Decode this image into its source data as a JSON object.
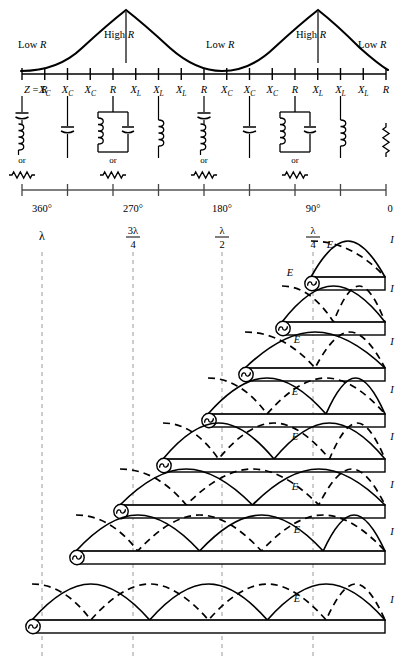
{
  "figure": {
    "impedance_curve": {
      "labels": [
        {
          "text": "Low R",
          "x": 38,
          "y": 44
        },
        {
          "text": "High R",
          "x": 128,
          "y": 38
        },
        {
          "text": "Low R",
          "x": 228,
          "y": 44
        },
        {
          "text": "High R",
          "x": 320,
          "y": 38
        },
        {
          "text": "Low R",
          "x": 382,
          "y": 44
        }
      ]
    },
    "impedance_axis": {
      "tick_labels": [
        "Z = R",
        "X_C",
        "X_C",
        "X_C",
        "R",
        "X_L",
        "X_L",
        "X_L",
        "R",
        "X_C",
        "X_C",
        "X_C",
        "R",
        "X_L",
        "X_L",
        "X_L",
        "R"
      ],
      "tick_display": [
        {
          "main": "Z = R",
          "sub": ""
        },
        {
          "main": "X",
          "sub": "C"
        },
        {
          "main": "X",
          "sub": "C"
        },
        {
          "main": "X",
          "sub": "C"
        },
        {
          "main": "R",
          "sub": ""
        },
        {
          "main": "X",
          "sub": "L"
        },
        {
          "main": "X",
          "sub": "L"
        },
        {
          "main": "X",
          "sub": "L"
        },
        {
          "main": "R",
          "sub": ""
        },
        {
          "main": "X",
          "sub": "C"
        },
        {
          "main": "X",
          "sub": "C"
        },
        {
          "main": "X",
          "sub": "C"
        },
        {
          "main": "R",
          "sub": ""
        },
        {
          "main": "X",
          "sub": "L"
        },
        {
          "main": "X",
          "sub": "L"
        },
        {
          "main": "X",
          "sub": "L"
        },
        {
          "main": "R",
          "sub": ""
        }
      ]
    },
    "equivalent_circuits": [
      {
        "index": 0,
        "type": "series-LC",
        "or_label": "or",
        "alt": "resistor"
      },
      {
        "index": 1,
        "type": "capacitor",
        "or_label": "",
        "alt": ""
      },
      {
        "index": 2,
        "type": "parallel-LC-tank",
        "or_label": "or",
        "alt": "resistor"
      },
      {
        "index": 3,
        "type": "inductor",
        "or_label": "",
        "alt": ""
      },
      {
        "index": 4,
        "type": "series-LC",
        "or_label": "or",
        "alt": "resistor"
      },
      {
        "index": 5,
        "type": "capacitor",
        "or_label": "",
        "alt": ""
      },
      {
        "index": 6,
        "type": "parallel-LC-tank",
        "or_label": "or",
        "alt": "resistor"
      },
      {
        "index": 7,
        "type": "inductor",
        "or_label": "",
        "alt": ""
      },
      {
        "index": 8,
        "type": "resistor-vertical",
        "or_label": "",
        "alt": ""
      }
    ],
    "degree_axis": {
      "labels": [
        {
          "text": "360°",
          "x": 42
        },
        {
          "text": "270°",
          "x": 133
        },
        {
          "text": "180°",
          "x": 222
        },
        {
          "text": "90°",
          "x": 313
        },
        {
          "text": "0",
          "x": 390
        }
      ]
    },
    "wavelength_markers": [
      {
        "num": "",
        "den": "",
        "whole": "λ",
        "x": 42
      },
      {
        "num": "3λ",
        "den": "4",
        "whole": "",
        "x": 133
      },
      {
        "num": "λ",
        "den": "2",
        "whole": "",
        "x": 222
      },
      {
        "num": "λ",
        "den": "4",
        "whole": "",
        "x": 313
      }
    ],
    "line_rows": [
      {
        "index": 0,
        "length_label": "λ/4",
        "left": 311,
        "right": 385,
        "baseline": 277,
        "arcs": 0.5,
        "E_label": "E",
        "I_label": "I",
        "E_label_pos": {
          "x": 330,
          "y": 248
        },
        "I_label_pos": {
          "x": 392,
          "y": 243
        }
      },
      {
        "index": 1,
        "length_label": "λ/2",
        "left": 282,
        "right": 385,
        "baseline": 322,
        "arcs": 1,
        "E_label": "E",
        "I_label": "I",
        "E_label_pos": {
          "x": 290,
          "y": 276
        },
        "I_label_pos": {
          "x": 392,
          "y": 292
        }
      },
      {
        "index": 2,
        "length_label": "3λ/4",
        "left": 245,
        "right": 385,
        "baseline": 368,
        "arcs": 1,
        "E_label": "E",
        "I_label": "I",
        "E_label_pos": {
          "x": 297,
          "y": 343
        },
        "I_label_pos": {
          "x": 392,
          "y": 345
        }
      },
      {
        "index": 3,
        "length_label": "λ",
        "left": 208,
        "right": 385,
        "baseline": 414,
        "arcs": 1.5,
        "E_label": "E",
        "I_label": "I",
        "E_label_pos": {
          "x": 295,
          "y": 395
        },
        "I_label_pos": {
          "x": 392,
          "y": 393
        }
      },
      {
        "index": 4,
        "length_label": "5λ/4",
        "left": 163,
        "right": 385,
        "baseline": 459,
        "arcs": 2,
        "E_label": "E",
        "I_label": "I",
        "E_label_pos": {
          "x": 295,
          "y": 440
        },
        "I_label_pos": {
          "x": 392,
          "y": 440
        }
      },
      {
        "index": 5,
        "length_label": "3λ/2",
        "left": 120,
        "right": 385,
        "baseline": 505,
        "arcs": 2,
        "E_label": "E",
        "I_label": "I",
        "E_label_pos": {
          "x": 295,
          "y": 490
        },
        "I_label_pos": {
          "x": 392,
          "y": 488
        }
      },
      {
        "index": 6,
        "length_label": "7λ/4",
        "left": 76,
        "right": 385,
        "baseline": 551,
        "arcs": 2.5,
        "E_label": "E",
        "I_label": "I",
        "E_label_pos": {
          "x": 297,
          "y": 533
        },
        "I_label_pos": {
          "x": 392,
          "y": 535
        }
      },
      {
        "index": 7,
        "length_label": "2λ",
        "left": 32,
        "right": 385,
        "baseline": 620,
        "arcs": 3,
        "E_label": "E",
        "I_label": "I",
        "E_label_pos": {
          "x": 297,
          "y": 602
        },
        "I_label_pos": {
          "x": 392,
          "y": 603
        }
      }
    ],
    "legend": {
      "E_meaning": "E",
      "I_meaning": "I",
      "E_style": "solid",
      "I_style": "dashed"
    },
    "colors": {
      "ink": "#000000",
      "background": "#ffffff",
      "guide": "#9a9a9a",
      "line_fill": "#ffffff"
    }
  }
}
